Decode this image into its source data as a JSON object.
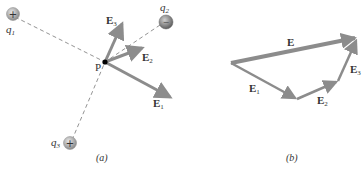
{
  "panel_a": {
    "caption": "(a)",
    "point_label": "P",
    "charges": [
      {
        "name": "q",
        "sub": "1",
        "sign": "+",
        "color": "#9a9a9a"
      },
      {
        "name": "q",
        "sub": "2",
        "sign": "−",
        "color": "#7d7d7d"
      },
      {
        "name": "q",
        "sub": "3",
        "sign": "+",
        "color": "#9a9a9a"
      }
    ],
    "vectors": [
      {
        "name": "E",
        "sub": "1"
      },
      {
        "name": "E",
        "sub": "2"
      },
      {
        "name": "E",
        "sub": "3"
      }
    ]
  },
  "panel_b": {
    "caption": "(b)",
    "resultant": {
      "name": "E"
    },
    "vectors": [
      {
        "name": "E",
        "sub": "1"
      },
      {
        "name": "E",
        "sub": "2"
      },
      {
        "name": "E",
        "sub": "3"
      }
    ]
  },
  "colors": {
    "arrow": "#8c8c8c",
    "dash": "#777777",
    "point": "#000000"
  }
}
